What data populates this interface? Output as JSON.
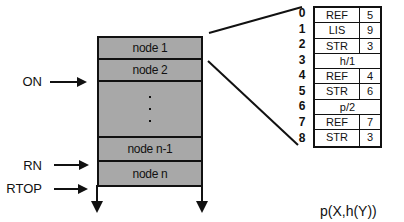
{
  "stack": {
    "nodes": [
      {
        "label": "node 1"
      },
      {
        "label": "node 2"
      },
      {
        "label": ""
      },
      {
        "label": "node n-1"
      },
      {
        "label": "node n"
      }
    ],
    "ellipsis": "⋮"
  },
  "pointers": [
    {
      "label": "ON",
      "target": "node 2 bottom"
    },
    {
      "label": "RN",
      "target": "node n top"
    },
    {
      "label": "RTOP",
      "target": "stack bottom"
    }
  ],
  "expansion_table": {
    "indices": [
      "0",
      "1",
      "2",
      "3",
      "4",
      "5",
      "6",
      "7",
      "8"
    ],
    "rows": [
      {
        "tag": "REF",
        "value": "5"
      },
      {
        "tag": "LIS",
        "value": "9"
      },
      {
        "tag": "STR",
        "value": "3"
      },
      {
        "span": "h/1"
      },
      {
        "tag": "REF",
        "value": "4"
      },
      {
        "tag": "STR",
        "value": "6"
      },
      {
        "span": "p/2"
      },
      {
        "tag": "REF",
        "value": "7"
      },
      {
        "tag": "STR",
        "value": "3"
      }
    ]
  },
  "caption": "p(X,h(Y))"
}
